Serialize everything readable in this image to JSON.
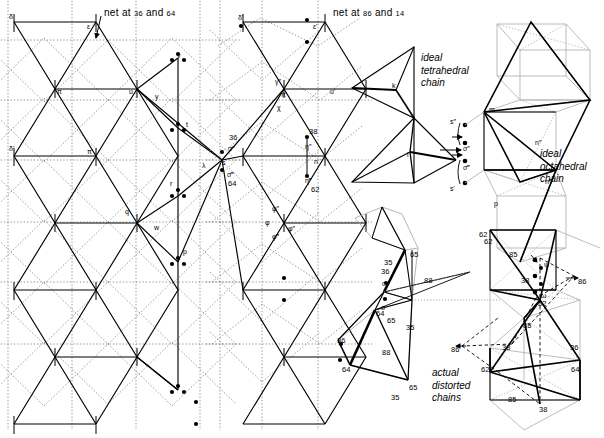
{
  "figure": {
    "title_hidden": "crystal structure chain projection diagram",
    "background": "#ffffff",
    "stroke": "#000000",
    "faint": "#b9b9b9",
    "width": 604,
    "height": 438
  },
  "captions": {
    "net_left_prefix": "net at ",
    "net_left_a": "36",
    "net_left_mid": " and ",
    "net_left_b": "64",
    "net_right_prefix": "net at ",
    "net_right_a": "86",
    "net_right_mid": " and ",
    "net_right_b": "14",
    "ideal_tetrahedral": "ideal\ntetrahedral\nchain",
    "ideal_octahedral": "ideal\noctahedral\nchain",
    "actual_distorted": "actual\ndistorted\nchains"
  },
  "labels_left_net": [
    {
      "id": "delta",
      "text": "δ",
      "x": 9,
      "y": 13
    },
    {
      "id": "epsilon",
      "text": "ε",
      "x": 87,
      "y": 23
    },
    {
      "id": "pi",
      "text": "π",
      "x": 57,
      "y": 88
    },
    {
      "id": "delta-p",
      "text": "δ'",
      "x": 9,
      "y": 145
    },
    {
      "id": "pi-p",
      "text": "π'",
      "x": 87,
      "y": 148
    },
    {
      "id": "u",
      "text": "u",
      "x": 129,
      "y": 88
    },
    {
      "id": "v",
      "text": "v",
      "x": 177,
      "y": 52
    },
    {
      "id": "y",
      "text": "y",
      "x": 155,
      "y": 93
    },
    {
      "id": "t",
      "text": "t",
      "x": 186,
      "y": 121
    },
    {
      "id": "lambda",
      "text": "λ",
      "x": 202,
      "y": 162
    },
    {
      "id": "r",
      "text": "r",
      "x": 170,
      "y": 180
    },
    {
      "id": "q",
      "text": "q",
      "x": 125,
      "y": 208
    },
    {
      "id": "w",
      "text": "w",
      "x": 154,
      "y": 224
    },
    {
      "id": "p",
      "text": "p",
      "x": 183,
      "y": 248
    }
  ],
  "labels_mid_net": [
    {
      "id": "num-36",
      "text": "36",
      "x": 229,
      "y": 134,
      "cls": "num"
    },
    {
      "id": "sigma-2",
      "text": "σ″",
      "x": 228,
      "y": 145
    },
    {
      "id": "s",
      "text": "s",
      "x": 222,
      "y": 159
    },
    {
      "id": "sigma-3",
      "text": "σ‴",
      "x": 227,
      "y": 171
    },
    {
      "id": "num-64",
      "text": "64",
      "x": 228,
      "y": 180,
      "cls": "num"
    },
    {
      "id": "phi-2",
      "text": "φ″",
      "x": 272,
      "y": 205
    },
    {
      "id": "phi",
      "text": "φ",
      "x": 265,
      "y": 219
    },
    {
      "id": "phi-3",
      "text": "φ‴",
      "x": 272,
      "y": 233
    }
  ],
  "labels_right_net": [
    {
      "id": "delta-pp",
      "text": "δ'",
      "x": 238,
      "y": 14
    },
    {
      "id": "epsilon-p",
      "text": "ε'",
      "x": 313,
      "y": 23
    },
    {
      "id": "gamma-2",
      "text": "γ″",
      "x": 275,
      "y": 78
    },
    {
      "id": "pi-pp",
      "text": "π'",
      "x": 281,
      "y": 91
    },
    {
      "id": "chi",
      "text": "χ",
      "x": 277,
      "y": 104
    },
    {
      "id": "u-p",
      "text": "u'",
      "x": 330,
      "y": 88
    },
    {
      "id": "num-38",
      "text": "38",
      "x": 309,
      "y": 128,
      "cls": "num"
    },
    {
      "id": "eta-2",
      "text": "η″",
      "x": 305,
      "y": 143
    },
    {
      "id": "n",
      "text": "n",
      "x": 314,
      "y": 158
    },
    {
      "id": "eta-3",
      "text": "η‴",
      "x": 305,
      "y": 177
    },
    {
      "id": "num-62",
      "text": "62",
      "x": 311,
      "y": 186,
      "cls": "num"
    },
    {
      "id": "phi-pp",
      "text": "φ″",
      "x": 288,
      "y": 225
    }
  ],
  "labels_tetra": [
    {
      "id": "k",
      "text": "k",
      "x": 392,
      "y": 82
    },
    {
      "id": "l",
      "text": "l",
      "x": 407,
      "y": 151
    }
  ],
  "labels_octa": [
    {
      "id": "s-2",
      "text": "s″",
      "x": 450,
      "y": 118
    },
    {
      "id": "sigma-2b",
      "text": "σ″",
      "x": 463,
      "y": 145
    },
    {
      "id": "sigma-3b",
      "text": "σ‴",
      "x": 463,
      "y": 164
    },
    {
      "id": "s-p",
      "text": "s'",
      "x": 450,
      "y": 185
    },
    {
      "id": "m",
      "text": "m",
      "x": 489,
      "y": 106
    },
    {
      "id": "n-2",
      "text": "n″",
      "x": 535,
      "y": 139
    },
    {
      "id": "n-3",
      "text": "n‴",
      "x": 545,
      "y": 178
    },
    {
      "id": "p-oct",
      "text": "p",
      "x": 494,
      "y": 200
    },
    {
      "id": "num-62-oct",
      "text": "62",
      "x": 484,
      "y": 238,
      "cls": "num"
    }
  ],
  "labels_distorted": [
    {
      "id": "d-65-a",
      "text": "65",
      "x": 410,
      "y": 251,
      "cls": "num"
    },
    {
      "id": "d-35-a",
      "text": "35",
      "x": 384,
      "y": 259,
      "cls": "num"
    },
    {
      "id": "d-88-a",
      "text": "88",
      "x": 424,
      "y": 277,
      "cls": "num"
    },
    {
      "id": "d-36-a",
      "text": "36",
      "x": 381,
      "y": 268,
      "cls": "num"
    },
    {
      "id": "d-sig-a",
      "text": "σ",
      "x": 382,
      "y": 280
    },
    {
      "id": "d-sig-b",
      "text": "σ",
      "x": 381,
      "y": 304
    },
    {
      "id": "d-64-a",
      "text": "64",
      "x": 376,
      "y": 310,
      "cls": "num"
    },
    {
      "id": "d-65-b",
      "text": "65",
      "x": 387,
      "y": 317,
      "cls": "num"
    },
    {
      "id": "d-35-b",
      "text": "35",
      "x": 406,
      "y": 324,
      "cls": "num"
    },
    {
      "id": "d-36-b",
      "text": "36",
      "x": 337,
      "y": 337,
      "cls": "num"
    },
    {
      "id": "d-88-b",
      "text": "88",
      "x": 382,
      "y": 349,
      "cls": "num"
    },
    {
      "id": "d-64-b",
      "text": "64",
      "x": 342,
      "y": 366,
      "cls": "num"
    },
    {
      "id": "d-65-c",
      "text": "65",
      "x": 409,
      "y": 384,
      "cls": "num"
    },
    {
      "id": "d-35-c",
      "text": "35",
      "x": 391,
      "y": 394,
      "cls": "num"
    }
  ],
  "labels_distorted_right": [
    {
      "id": "r-62-a",
      "text": "62",
      "x": 479,
      "y": 231,
      "cls": "num"
    },
    {
      "id": "r-85-a",
      "text": "85",
      "x": 509,
      "y": 251,
      "cls": "num"
    },
    {
      "id": "r-psi",
      "text": "ψ",
      "x": 544,
      "y": 261
    },
    {
      "id": "r-38-a",
      "text": "38",
      "x": 521,
      "y": 277,
      "cls": "num"
    },
    {
      "id": "r-86-a",
      "text": "86",
      "x": 578,
      "y": 278,
      "cls": "num"
    },
    {
      "id": "r-omega",
      "text": "ω",
      "x": 541,
      "y": 292
    },
    {
      "id": "r-62-b",
      "text": "62",
      "x": 538,
      "y": 300,
      "cls": "num"
    },
    {
      "id": "r-85-b",
      "text": "85",
      "x": 523,
      "y": 322,
      "cls": "num"
    },
    {
      "id": "r-38-b",
      "text": "38",
      "x": 502,
      "y": 344,
      "cls": "num"
    },
    {
      "id": "r-86-b",
      "text": "86",
      "x": 451,
      "y": 346,
      "cls": "num"
    },
    {
      "id": "r-36-b",
      "text": "36",
      "x": 570,
      "y": 344,
      "cls": "num"
    },
    {
      "id": "r-62-c",
      "text": "62",
      "x": 481,
      "y": 366,
      "cls": "num"
    },
    {
      "id": "r-64-b",
      "text": "64",
      "x": 571,
      "y": 366,
      "cls": "num"
    },
    {
      "id": "r-85-c",
      "text": "85",
      "x": 508,
      "y": 396,
      "cls": "num"
    },
    {
      "id": "r-38-c",
      "text": "38",
      "x": 539,
      "y": 406,
      "cls": "num"
    }
  ],
  "chart_data": {
    "type": "diagram",
    "panels": [
      "net at 36 and 64",
      "net at 86 and 14",
      "ideal tetrahedral chain",
      "ideal octahedral chain",
      "actual distorted chains"
    ],
    "height_values": [
      14,
      35,
      36,
      38,
      62,
      64,
      65,
      85,
      86,
      88
    ]
  }
}
